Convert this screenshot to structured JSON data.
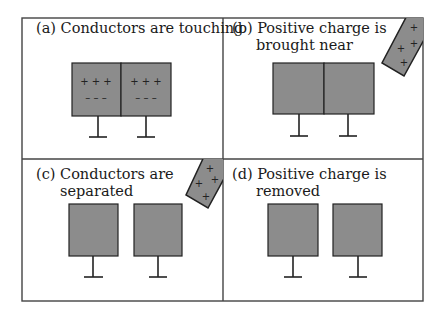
{
  "figure": {
    "panels": [
      {
        "id": "a",
        "label_line1": "(a) Conductors are touching",
        "label_line2": "",
        "state": "touching",
        "charge_rod": false,
        "left_charges": {
          "top": "+ + +",
          "bottom": "– – –"
        },
        "right_charges": {
          "top": "+ + +",
          "bottom": "– – –"
        }
      },
      {
        "id": "b",
        "label_line1": "(b) Positive charge is",
        "label_line2": "brought near",
        "state": "touching",
        "charge_rod": true,
        "rod_charges": [
          "+",
          "+",
          "+",
          "+"
        ]
      },
      {
        "id": "c",
        "label_line1": "(c) Conductors are",
        "label_line2": "separated",
        "state": "separated",
        "charge_rod": true,
        "rod_charges": [
          "+",
          "+",
          "+",
          "+"
        ]
      },
      {
        "id": "d",
        "label_line1": "(d) Positive charge is",
        "label_line2": "removed",
        "state": "separated",
        "charge_rod": false
      }
    ],
    "colors": {
      "conductor_fill": "#8c8c8c",
      "outline": "#222222",
      "frame": "#444444",
      "background": "#ffffff"
    }
  }
}
